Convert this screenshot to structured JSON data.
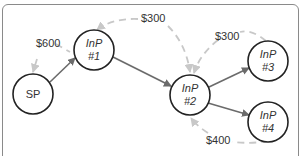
{
  "diagram": {
    "nodes": [
      {
        "id": "sp",
        "line1": "SP",
        "line2": ""
      },
      {
        "id": "inp1",
        "line1": "InP",
        "line2": "#1"
      },
      {
        "id": "inp2",
        "line1": "InP",
        "line2": "#2"
      },
      {
        "id": "inp3",
        "line1": "InP",
        "line2": "#3"
      },
      {
        "id": "inp4",
        "line1": "InP",
        "line2": "#4"
      }
    ],
    "solid_edges": [
      {
        "from": "SP",
        "to": "InP #1"
      },
      {
        "from": "InP #1",
        "to": "InP #2"
      },
      {
        "from": "InP #2",
        "to": "InP #3"
      },
      {
        "from": "InP #2",
        "to": "InP #4"
      }
    ],
    "payment_edges": [
      {
        "label": "$600",
        "from": "InP #1",
        "to": "SP"
      },
      {
        "label": "$300",
        "from": "InP #2",
        "to": "InP #1"
      },
      {
        "label": "$300",
        "from": "InP #3",
        "to": "InP #2"
      },
      {
        "label": "$400",
        "from": "InP #4",
        "to": "InP #2"
      }
    ]
  },
  "colors": {
    "node_stroke": "#222222",
    "solid_edge": "#6b6b6b",
    "dashed_edge": "#c8c8c8",
    "frame": "#8a8a8a"
  }
}
